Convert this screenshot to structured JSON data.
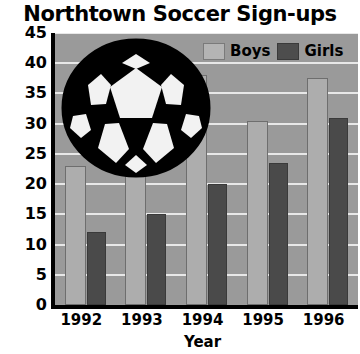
{
  "chart_data": {
    "type": "bar",
    "title": "Northtown Soccer Sign-ups",
    "xlabel": "Year",
    "ylabel": "",
    "categories": [
      "1992",
      "1993",
      "1994",
      "1995",
      "1996"
    ],
    "series": [
      {
        "name": "Boys",
        "color": "#adadad",
        "values": [
          23,
          26,
          38,
          30.5,
          37.5
        ]
      },
      {
        "name": "Girls",
        "color": "#4a4a4a",
        "values": [
          12,
          15,
          20,
          23.5,
          31
        ]
      }
    ],
    "ylim": [
      0,
      45
    ],
    "yticks": [
      0,
      5,
      10,
      15,
      20,
      25,
      30,
      35,
      40,
      45
    ],
    "ytick_labels": [
      "0",
      "5",
      "10",
      "15",
      "20",
      "25",
      "30",
      "35",
      "40",
      "45"
    ],
    "grid": true,
    "legend_position": "top-right",
    "legend": [
      {
        "label": "Boys",
        "swatch": "light-gray"
      },
      {
        "label": "Girls",
        "swatch": "dark-gray"
      }
    ],
    "annotations": [
      {
        "type": "image",
        "name": "soccer-ball",
        "description": "black and white soccer ball illustration overlaying upper-left plot area"
      }
    ],
    "plot_background": "#9a9a9a",
    "gridline_color": "#e8e8e8",
    "axis_color": "#000000"
  }
}
